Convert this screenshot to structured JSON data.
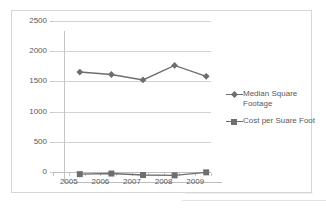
{
  "chart_data": {
    "type": "line",
    "title": "",
    "xlabel": "",
    "ylabel": "",
    "categories": [
      "2005",
      "2006",
      "2007",
      "2008",
      "2009"
    ],
    "ylim": [
      0,
      2500
    ],
    "yticks": [
      "0",
      "500",
      "1000",
      "1500",
      "2000",
      "2500"
    ],
    "ytick_values": [
      0,
      500,
      1000,
      1500,
      2000,
      2500
    ],
    "grid": true,
    "legend_position": "right",
    "series": [
      {
        "name": "Median Square Footage",
        "marker": "diamond",
        "color": "#6e6e70",
        "values": [
          1820,
          1780,
          1690,
          1930,
          1750
        ]
      },
      {
        "name": "Cost per Suare Foot",
        "marker": "square",
        "color": "#6e6e70",
        "values": [
          130,
          140,
          115,
          110,
          160
        ]
      }
    ]
  },
  "legend": {
    "entries": [
      {
        "label": "Median Square\nFootage",
        "marker": "diamond-marker"
      },
      {
        "label": "Cost per Suare Foot",
        "marker": "square-marker"
      }
    ]
  },
  "colors": {
    "series_gray": "#6e6e70",
    "gridline": "#d2d2d2",
    "axis": "#bdbdbd",
    "border": "#d6d6d6",
    "text": "#59595b",
    "background": "#ffffff"
  }
}
